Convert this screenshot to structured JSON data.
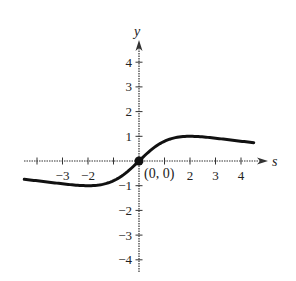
{
  "chart_data": {
    "type": "line",
    "title": "",
    "xlabel": "s",
    "ylabel": "y",
    "xlim": [
      -4.5,
      4.5
    ],
    "ylim": [
      -4.5,
      4.5
    ],
    "grid": false,
    "x_ticks": [
      -4,
      -3,
      -2,
      -1,
      1,
      2,
      3,
      4
    ],
    "x_tick_labels": [
      {
        "value": -3,
        "label": "−3"
      },
      {
        "value": -2,
        "label": "−2"
      },
      {
        "value": 2,
        "label": "2"
      },
      {
        "value": 3,
        "label": "3"
      },
      {
        "value": 4,
        "label": "4"
      }
    ],
    "y_ticks": [
      -4,
      -3,
      -2,
      -1,
      1,
      2,
      3,
      4
    ],
    "y_tick_labels": [
      {
        "value": 4,
        "label": "4"
      },
      {
        "value": 3,
        "label": "3"
      },
      {
        "value": 2,
        "label": "2"
      },
      {
        "value": 1,
        "label": "1"
      },
      {
        "value": -1,
        "label": "−1"
      },
      {
        "value": -2,
        "label": "−2"
      },
      {
        "value": -3,
        "label": "−3"
      },
      {
        "value": -4,
        "label": "−4"
      }
    ],
    "series": [
      {
        "name": "y = 4s/(4+s^2)",
        "x": [
          -4.5,
          -4,
          -3,
          -2,
          -1,
          0,
          1,
          2,
          3,
          4,
          4.5
        ],
        "values": [
          -0.74,
          -0.8,
          -0.92,
          -1.0,
          -0.8,
          0,
          0.8,
          1.0,
          0.92,
          0.8,
          0.74
        ]
      }
    ],
    "annotations": [
      {
        "type": "point",
        "x": 0,
        "y": 0,
        "label": "(0, 0)"
      }
    ]
  },
  "axes": {
    "x_label": "s",
    "y_label": "y",
    "origin_label": "(0, 0)"
  }
}
